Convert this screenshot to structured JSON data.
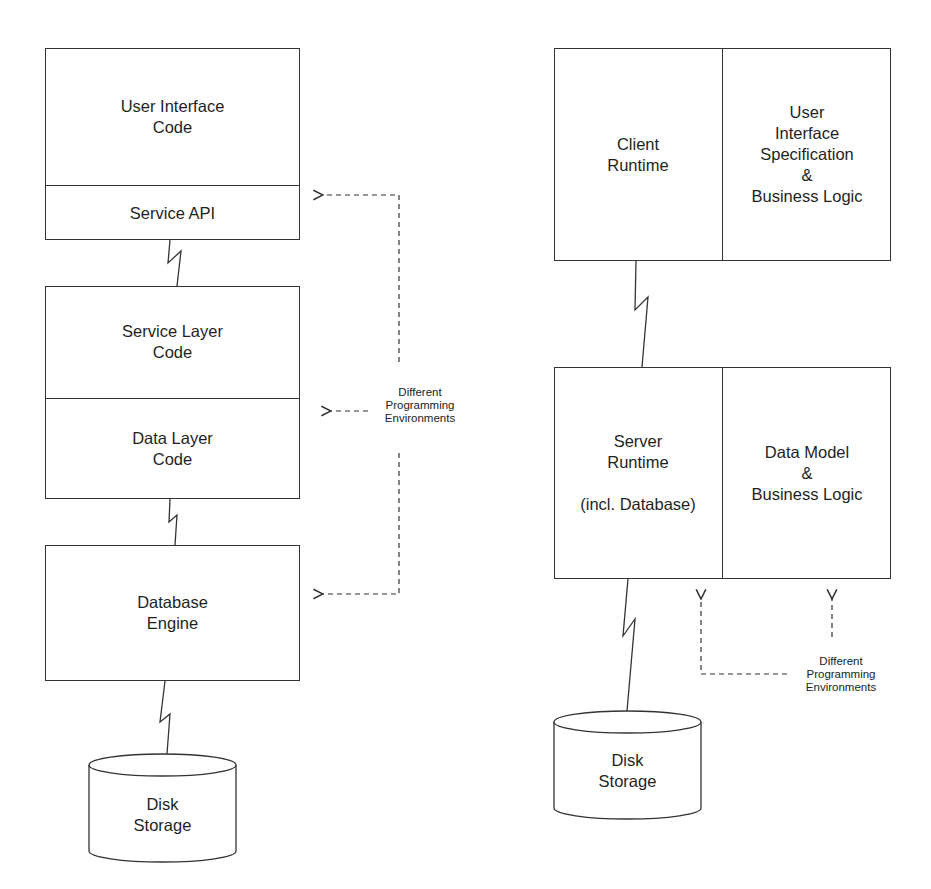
{
  "left_stack": {
    "top_box": {
      "upper": "User Interface\nCode",
      "lower": "Service API"
    },
    "middle_box": {
      "upper": "Service Layer\nCode",
      "lower": "Data Layer\nCode"
    },
    "bottom_box": {
      "label": "Database\nEngine"
    },
    "storage": {
      "label": "Disk\nStorage"
    },
    "annotation": "Different\nProgramming\nEnvironments"
  },
  "right_stack": {
    "top_box": {
      "left": "Client\nRuntime",
      "right": "User\nInterface\nSpecification\n&\nBusiness Logic"
    },
    "bottom_box": {
      "left": "Server\nRuntime\n\n(incl. Database)",
      "right": "Data Model\n&\nBusiness Logic"
    },
    "storage": {
      "label": "Disk\nStorage"
    },
    "annotation": "Different\nProgramming\nEnvironments"
  },
  "colors": {
    "line": "#333333",
    "text": "#1f1f1f",
    "background": "#ffffff"
  }
}
